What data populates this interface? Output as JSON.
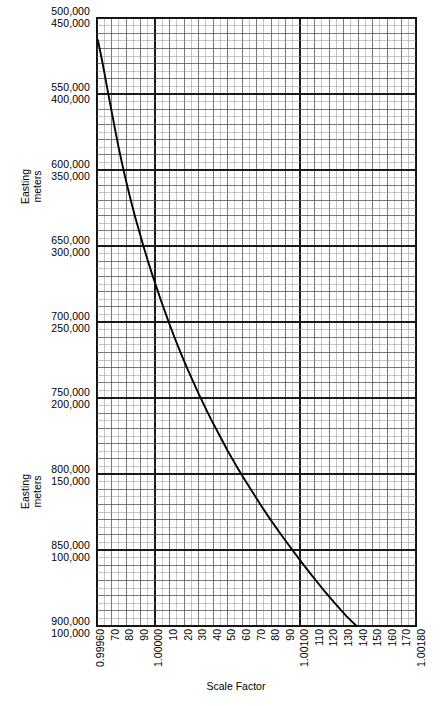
{
  "chart_data": {
    "type": "line",
    "title": "",
    "xlabel": "Scale Factor",
    "ylabel": "Easting meters",
    "grid": true,
    "legend": "none",
    "xlim": [
      0.9996,
      1.0018
    ],
    "x_tick_labels": [
      "0.99960",
      "70",
      "80",
      "90",
      "1.00000",
      "10",
      "20",
      "30",
      "40",
      "50",
      "60",
      "70",
      "80",
      "90",
      "1.00100",
      "110",
      "120",
      "130",
      "140",
      "150",
      "160",
      "170",
      "1.00180"
    ],
    "x_tick_values": [
      0.9996,
      0.9997,
      0.9998,
      0.9999,
      1.0,
      1.0001,
      1.0002,
      1.0003,
      1.0004,
      1.0005,
      1.0006,
      1.0007,
      1.0008,
      1.0009,
      1.001,
      1.0011,
      1.0012,
      1.0013,
      1.0014,
      1.0015,
      1.0016,
      1.0017,
      1.0018
    ],
    "x_major_ticks": [
      0.9996,
      1.0,
      1.001,
      1.0018
    ],
    "y_axis_upper_labels": [
      "500,000",
      "550,000",
      "600,000",
      "650,000",
      "700,000",
      "750,000",
      "800,000",
      "850,000",
      "900,000"
    ],
    "y_axis_lower_labels": [
      "450,000",
      "400,000",
      "350,000",
      "300,000",
      "250,000",
      "200,000",
      "150,000",
      "100,000"
    ],
    "ylim_upper": [
      500000,
      900000
    ],
    "series": [
      {
        "name": "Easting vs Scale Factor",
        "points": [
          [
            0.9996,
            513000
          ],
          [
            0.999608,
            515500
          ],
          [
            0.99962,
            521000
          ],
          [
            0.999635,
            528000
          ],
          [
            0.99965,
            535500
          ],
          [
            0.99967,
            546000
          ],
          [
            0.99969,
            556000
          ],
          [
            0.99971,
            566000
          ],
          [
            0.99973,
            576000
          ],
          [
            0.99975,
            585500
          ],
          [
            0.99977,
            594500
          ],
          [
            0.99979,
            603000
          ],
          [
            0.999815,
            613000
          ],
          [
            0.99984,
            622500
          ],
          [
            0.999865,
            631500
          ],
          [
            0.99989,
            640000
          ],
          [
            0.99992,
            650000
          ],
          [
            0.99995,
            659500
          ],
          [
            0.99998,
            668500
          ],
          [
            1.00001,
            677000
          ],
          [
            1.00004,
            685500
          ],
          [
            1.00007,
            693500
          ],
          [
            1.0001,
            701500
          ],
          [
            1.00014,
            711500
          ],
          [
            1.00018,
            721000
          ],
          [
            1.00022,
            730000
          ],
          [
            1.00026,
            738500
          ],
          [
            1.0003,
            747000
          ],
          [
            1.00035,
            757000
          ],
          [
            1.0004,
            766500
          ],
          [
            1.00045,
            775500
          ],
          [
            1.0005,
            784500
          ],
          [
            1.00056,
            794500
          ],
          [
            1.00062,
            804000
          ],
          [
            1.00068,
            813000
          ],
          [
            1.00074,
            822000
          ],
          [
            1.0008,
            830500
          ],
          [
            1.00087,
            840000
          ],
          [
            1.00094,
            849000
          ],
          [
            1.00101,
            858000
          ],
          [
            1.00108,
            866500
          ],
          [
            1.00116,
            876000
          ],
          [
            1.00124,
            885000
          ],
          [
            1.00132,
            893500
          ],
          [
            1.00139,
            900000
          ]
        ]
      }
    ]
  },
  "axis": {
    "y_title": "Easting meters",
    "x_title": "Scale Factor"
  }
}
